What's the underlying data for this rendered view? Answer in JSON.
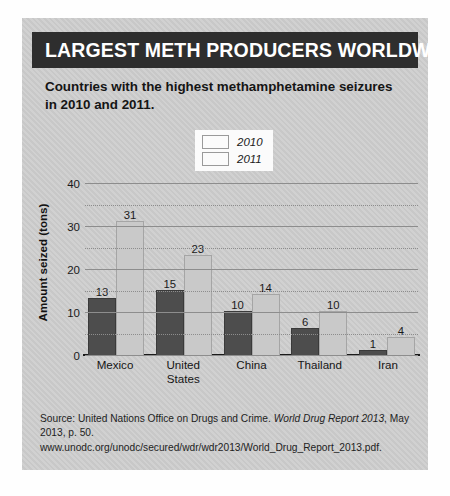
{
  "header": {
    "title": "LARGEST METH PRODUCERS WORLDWIDE",
    "banner_color": "#2e2e2e"
  },
  "subtitle": "Countries with the highest methamphetamine seizures in 2010 and 2011.",
  "legend": {
    "entries": [
      {
        "label": "2010",
        "color": "#4d4d4d"
      },
      {
        "label": "2011",
        "color": "#c9c9c9"
      }
    ]
  },
  "source": {
    "line1_pre": "Source: United Nations Office on Drugs and Crime. ",
    "line1_italic": "World Drug Report 2013",
    "line2": ", May 2013, p. 50. www.unodc.org/unodc/secured/wdr/wdr2013/World_Drug_Report_2013.pdf."
  },
  "chart_data": {
    "type": "bar",
    "title": "LARGEST METH PRODUCERS WORLDWIDE",
    "subtitle": "Countries with the highest methamphetamine seizures in 2010 and 2011.",
    "categories": [
      "Mexico",
      "United States",
      "China",
      "Thailand",
      "Iran"
    ],
    "series": [
      {
        "name": "2010",
        "color": "#4d4d4d",
        "values": [
          13,
          15,
          10,
          6,
          1
        ]
      },
      {
        "name": "2011",
        "color": "#c9c9c9",
        "values": [
          31,
          23,
          14,
          10,
          4
        ]
      }
    ],
    "xlabel": "",
    "ylabel": "Amount seized (tons)",
    "ylim": [
      0,
      40
    ],
    "yticks": [
      0,
      10,
      20,
      30,
      40
    ],
    "yticks_minor": [
      5,
      15,
      25,
      35
    ],
    "grid": true,
    "legend_position": "top-center",
    "value_labels": true
  }
}
